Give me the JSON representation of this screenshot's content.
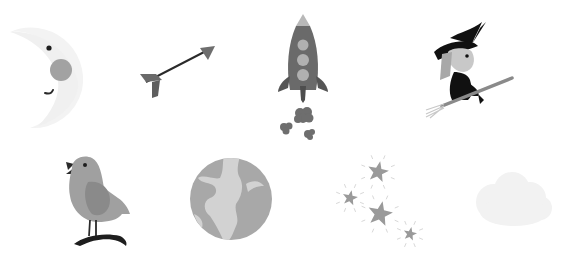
{
  "title": "",
  "icons": [
    {
      "id": "moon",
      "label": "crescent moon with face"
    },
    {
      "id": "arrow",
      "label": "arrow"
    },
    {
      "id": "rocket",
      "label": "rocket with smoke clouds"
    },
    {
      "id": "witch",
      "label": "witch on broomstick"
    },
    {
      "id": "bird",
      "label": "singing bird on branch"
    },
    {
      "id": "earth",
      "label": "globe"
    },
    {
      "id": "stars",
      "label": "sparkling stars"
    },
    {
      "id": "cloud",
      "label": "faint cloud"
    }
  ],
  "colors": {
    "background": "#ffffff",
    "dark": "#1e1e1e",
    "mid_gray": "#6e6e6e",
    "gray": "#9a9a9a",
    "light_gray": "#c4c4c4",
    "pale": "#f2f2f2"
  }
}
